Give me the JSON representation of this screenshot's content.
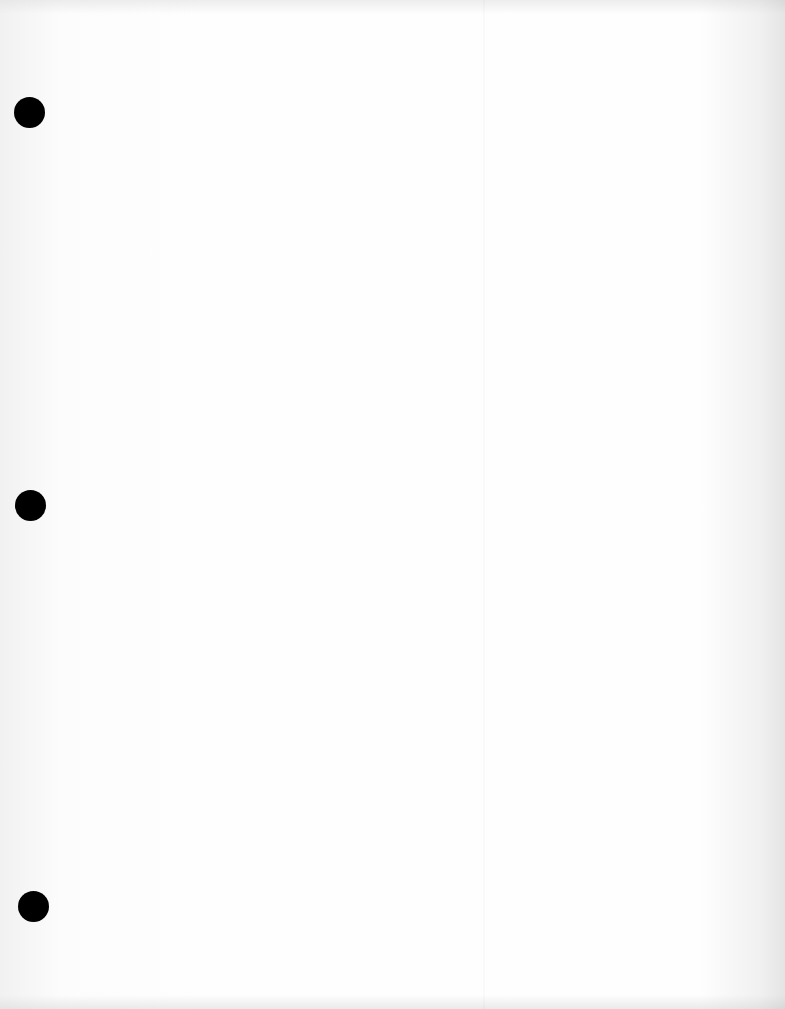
{
  "document": {
    "type": "blank-hole-punched-sheet",
    "text_content": "",
    "fold_line_x": 483,
    "punch_holes": [
      {
        "cx": 29,
        "cy": 112,
        "diameter": 31
      },
      {
        "cx": 30,
        "cy": 505,
        "diameter": 31
      },
      {
        "cx": 33,
        "cy": 906,
        "diameter": 31
      }
    ],
    "colors": {
      "paper": "#fefefe",
      "hole": "#000000"
    }
  }
}
